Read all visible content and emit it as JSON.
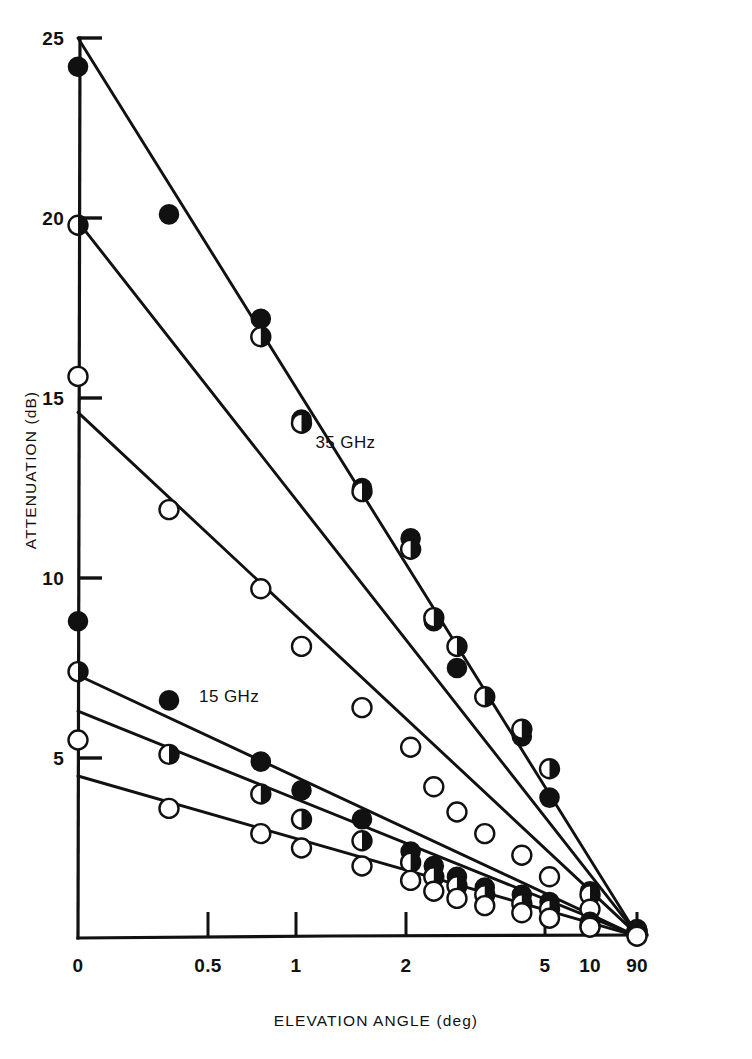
{
  "figure": {
    "background_color": "#ffffff",
    "ink_color": "#111111"
  },
  "axes": {
    "y_title": "ATTENUATION (dB)",
    "x_title": "ELEVATION ANGLE  (deg)"
  },
  "chart_data": {
    "type": "line",
    "title": "",
    "subtitle": "",
    "xlabel": "ELEVATION ANGLE  (deg)",
    "ylabel": "ATTENUATION (dB)",
    "grid": false,
    "legend_position": "inline-annotations",
    "x_scale": "reciprocal-cosecant",
    "x_tick_values": [
      0,
      0.5,
      1,
      2,
      5,
      10,
      90
    ],
    "x_tick_labels": [
      "0",
      "0.5",
      "1",
      "2",
      "5",
      "10",
      "90"
    ],
    "y_tick_values": [
      5,
      10,
      15,
      20,
      25
    ],
    "y_tick_labels": [
      "5",
      "10",
      "15",
      "20",
      "25"
    ],
    "ylim": [
      0,
      25
    ],
    "xlim": [
      0,
      90
    ],
    "annotations": [
      {
        "text": "35 GHz",
        "x": 1.45,
        "y": 13.6
      },
      {
        "text": "15 GHz",
        "x": 0.62,
        "y": 6.55
      }
    ],
    "series": [
      {
        "name": "35 GHz (filled)",
        "marker": "filled-circle",
        "fit_intercept": 25.0,
        "fit_endpoint": 0.1,
        "points": [
          {
            "x": 0.0,
            "y": 24.2
          },
          {
            "x": 0.35,
            "y": 20.1
          },
          {
            "x": 0.8,
            "y": 17.2
          },
          {
            "x": 1.05,
            "y": 14.4
          },
          {
            "x": 1.6,
            "y": 12.5
          },
          {
            "x": 2.1,
            "y": 11.1
          },
          {
            "x": 2.6,
            "y": 8.8
          },
          {
            "x": 3.1,
            "y": 7.5
          },
          {
            "x": 3.7,
            "y": 6.7
          },
          {
            "x": 4.5,
            "y": 5.6
          },
          {
            "x": 5.5,
            "y": 3.9
          },
          {
            "x": 10.0,
            "y": 1.3
          },
          {
            "x": 90.0,
            "y": 0.25
          }
        ]
      },
      {
        "name": "35 GHz (half-filled)",
        "marker": "half-circle",
        "fit_intercept": 19.9,
        "fit_endpoint": 0.1,
        "points": [
          {
            "x": 0.0,
            "y": 19.8
          },
          {
            "x": 0.8,
            "y": 16.7
          },
          {
            "x": 1.05,
            "y": 14.3
          },
          {
            "x": 1.6,
            "y": 12.4
          },
          {
            "x": 2.1,
            "y": 10.8
          },
          {
            "x": 2.6,
            "y": 8.9
          },
          {
            "x": 3.1,
            "y": 8.1
          },
          {
            "x": 3.7,
            "y": 6.7
          },
          {
            "x": 4.5,
            "y": 5.8
          },
          {
            "x": 5.5,
            "y": 4.7
          },
          {
            "x": 10.0,
            "y": 1.2
          },
          {
            "x": 90.0,
            "y": 0.2
          }
        ]
      },
      {
        "name": "35 GHz (open)",
        "marker": "open-circle",
        "fit_intercept": 14.6,
        "fit_endpoint": 0.1,
        "points": [
          {
            "x": 0.0,
            "y": 15.6
          },
          {
            "x": 0.35,
            "y": 11.9
          },
          {
            "x": 0.8,
            "y": 9.7
          },
          {
            "x": 1.05,
            "y": 8.1
          },
          {
            "x": 1.6,
            "y": 6.4
          },
          {
            "x": 2.1,
            "y": 5.3
          },
          {
            "x": 2.6,
            "y": 4.2
          },
          {
            "x": 3.1,
            "y": 3.5
          },
          {
            "x": 3.7,
            "y": 2.9
          },
          {
            "x": 4.5,
            "y": 2.3
          },
          {
            "x": 5.5,
            "y": 1.7
          },
          {
            "x": 10.0,
            "y": 0.8
          },
          {
            "x": 90.0,
            "y": 0.15
          }
        ]
      },
      {
        "name": "15 GHz (filled)",
        "marker": "filled-circle",
        "fit_intercept": 7.3,
        "fit_endpoint": 0.05,
        "points": [
          {
            "x": 0.0,
            "y": 8.8
          },
          {
            "x": 0.35,
            "y": 6.6
          },
          {
            "x": 0.8,
            "y": 4.9
          },
          {
            "x": 1.05,
            "y": 4.1
          },
          {
            "x": 1.6,
            "y": 3.3
          },
          {
            "x": 2.1,
            "y": 2.4
          },
          {
            "x": 2.6,
            "y": 2.0
          },
          {
            "x": 3.1,
            "y": 1.7
          },
          {
            "x": 3.7,
            "y": 1.4
          },
          {
            "x": 4.5,
            "y": 1.2
          },
          {
            "x": 5.5,
            "y": 1.0
          },
          {
            "x": 10.0,
            "y": 0.45
          },
          {
            "x": 90.0,
            "y": 0.1
          }
        ]
      },
      {
        "name": "15 GHz (half-filled)",
        "marker": "half-circle",
        "fit_intercept": 6.3,
        "fit_endpoint": 0.05,
        "points": [
          {
            "x": 0.0,
            "y": 7.4
          },
          {
            "x": 0.35,
            "y": 5.1
          },
          {
            "x": 0.8,
            "y": 4.0
          },
          {
            "x": 1.05,
            "y": 3.3
          },
          {
            "x": 1.6,
            "y": 2.7
          },
          {
            "x": 2.1,
            "y": 2.1
          },
          {
            "x": 2.6,
            "y": 1.7
          },
          {
            "x": 3.1,
            "y": 1.45
          },
          {
            "x": 3.7,
            "y": 1.2
          },
          {
            "x": 4.5,
            "y": 0.95
          },
          {
            "x": 5.5,
            "y": 0.8
          },
          {
            "x": 10.0,
            "y": 0.35
          },
          {
            "x": 90.0,
            "y": 0.1
          }
        ]
      },
      {
        "name": "15 GHz (open)",
        "marker": "open-circle",
        "fit_intercept": 4.5,
        "fit_endpoint": 0.05,
        "points": [
          {
            "x": 0.0,
            "y": 5.5
          },
          {
            "x": 0.35,
            "y": 3.6
          },
          {
            "x": 0.8,
            "y": 2.9
          },
          {
            "x": 1.05,
            "y": 2.5
          },
          {
            "x": 1.6,
            "y": 2.0
          },
          {
            "x": 2.1,
            "y": 1.6
          },
          {
            "x": 2.6,
            "y": 1.3
          },
          {
            "x": 3.1,
            "y": 1.1
          },
          {
            "x": 3.7,
            "y": 0.9
          },
          {
            "x": 4.5,
            "y": 0.7
          },
          {
            "x": 5.5,
            "y": 0.55
          },
          {
            "x": 10.0,
            "y": 0.3
          },
          {
            "x": 90.0,
            "y": 0.05
          }
        ]
      }
    ]
  }
}
